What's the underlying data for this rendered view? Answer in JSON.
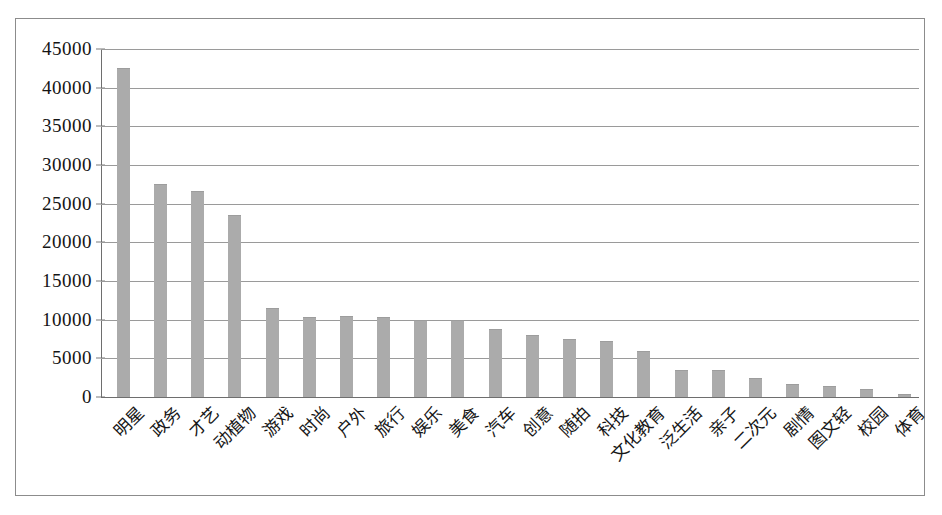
{
  "chart_data": {
    "type": "bar",
    "title": "",
    "subtitle": "",
    "xlabel": "",
    "ylabel": "",
    "ylim": [
      0,
      45000
    ],
    "y_ticks": [
      0,
      5000,
      10000,
      15000,
      20000,
      25000,
      30000,
      35000,
      40000,
      45000
    ],
    "y_tick_labels": [
      "0",
      "5000",
      "10000",
      "15000",
      "20000",
      "25000",
      "30000",
      "35000",
      "40000",
      "45000"
    ],
    "grid": true,
    "legend": "none",
    "bar_color": "#ababab",
    "plot_background": "#ffffff",
    "border_color": "#8c8c8c",
    "gridline_color": "#9a9a9a",
    "categories": [
      "明星",
      "政务",
      "才艺",
      "动植物",
      "游戏",
      "时尚",
      "户外",
      "旅行",
      "娱乐",
      "美食",
      "汽车",
      "创意",
      "随拍",
      "科技",
      "文化教育",
      "泛生活",
      "亲子",
      "二次元",
      "剧情",
      "图文轻",
      "校园",
      "体育"
    ],
    "values": [
      42500,
      27500,
      26700,
      23600,
      11500,
      10400,
      10500,
      10300,
      9900,
      9900,
      8800,
      8000,
      7500,
      7200,
      6000,
      3500,
      3500,
      2500,
      1700,
      1400,
      1100,
      400
    ]
  }
}
